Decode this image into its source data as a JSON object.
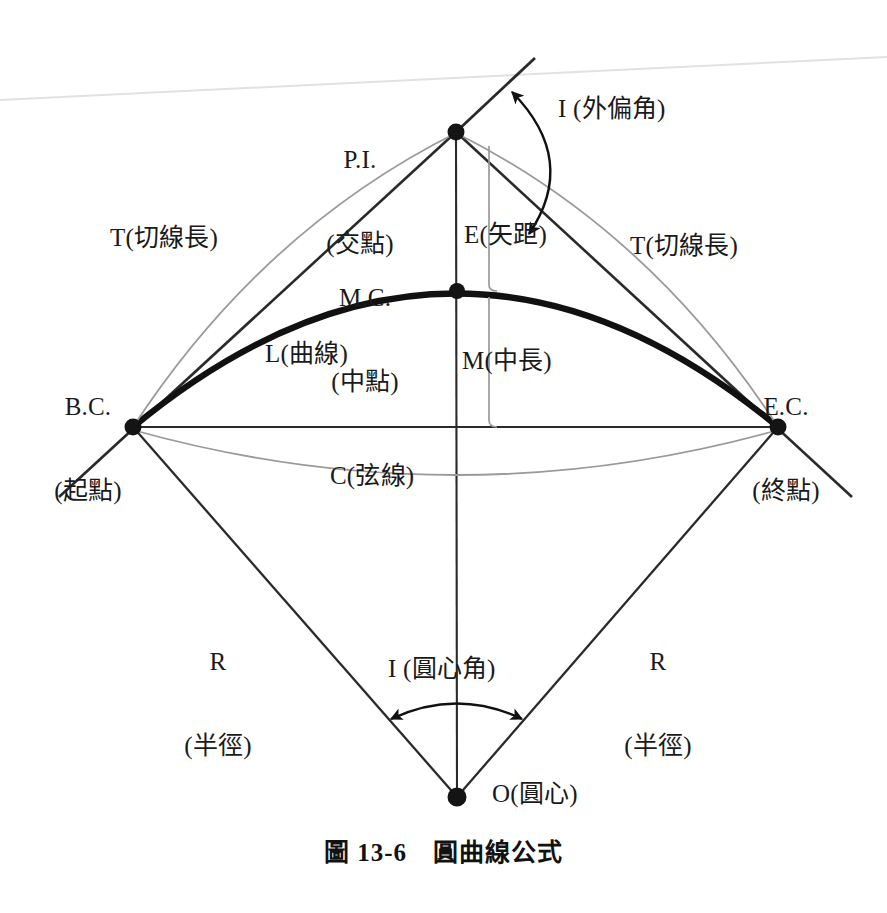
{
  "figure": {
    "caption_number": "圖 13-6",
    "caption_title": "圓曲線公式",
    "caption_full": "圖 13-6　圓曲線公式"
  },
  "colors": {
    "ink": "#1a1a1a",
    "curve": "#111111",
    "light_line": "#8d8d8d",
    "background": "#ffffff"
  },
  "labels": {
    "pi": {
      "code": "P.I.",
      "chinese": "(交點)"
    },
    "bc": {
      "code": "B.C.",
      "chinese": "(起點)"
    },
    "ec": {
      "code": "E.C.",
      "chinese": "(終點)"
    },
    "mc": {
      "code": "M.C.",
      "chinese": "(中點)"
    },
    "tangent_left": "T(切線長)",
    "tangent_right": "T(切線長)",
    "external": "E(矢距)",
    "middle_ordinate": "M(中長)",
    "arc_length": "L(曲線)",
    "chord": "C(弦線)",
    "radius_left": {
      "code": "R",
      "chinese": "(半徑)"
    },
    "radius_right": {
      "code": "R",
      "chinese": "(半徑)"
    },
    "deflection_angle": "I (外偏角)",
    "central_angle": "I (圓心角)",
    "center": "O(圓心)"
  },
  "geometry": {
    "points": {
      "PI": {
        "x": 456,
        "y": 132,
        "name": "point-of-intersection"
      },
      "BC": {
        "x": 133,
        "y": 427,
        "name": "begin-curve"
      },
      "EC": {
        "x": 778,
        "y": 427,
        "name": "end-curve"
      },
      "MC": {
        "x": 457,
        "y": 291,
        "name": "mid-curve"
      },
      "O": {
        "x": 457,
        "y": 797,
        "name": "center-of-circle"
      }
    }
  }
}
